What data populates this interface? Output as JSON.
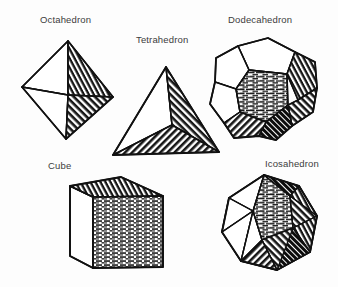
{
  "page": {
    "background_color": "#fdfdfd",
    "ink_color": "#1a1a1a",
    "label_color": "#3c3c3c",
    "width": 338,
    "height": 287,
    "style": "black-and-white scanned pen-and-ink line drawing with hatched shading"
  },
  "figures": [
    {
      "id": "octahedron",
      "label": "Octahedron",
      "faces": 8,
      "face_shape": "triangle",
      "label_position": {
        "x": 40,
        "y": 14
      },
      "shading": "right-hand faces hatched dark, left-hand faces left white"
    },
    {
      "id": "tetrahedron",
      "label": "Tetrahedron",
      "faces": 4,
      "face_shape": "triangle",
      "label_position": {
        "x": 136,
        "y": 34
      },
      "shading": "right face and bottom face hatched dark, left face white"
    },
    {
      "id": "dodecahedron",
      "label": "Dodecahedron",
      "faces": 12,
      "face_shape": "pentagon",
      "label_position": {
        "x": 228,
        "y": 14
      },
      "shading": "upper-left pentagons white, front and right pentagons hatched dark"
    },
    {
      "id": "cube",
      "label": "Cube",
      "faces": 6,
      "face_shape": "square",
      "label_position": {
        "x": 48,
        "y": 160
      },
      "shading": "front face horizontally hatched, top face diagonally hatched, left face white"
    },
    {
      "id": "icosahedron",
      "label": "Icosahedron",
      "faces": 20,
      "face_shape": "triangle",
      "label_position": {
        "x": 265,
        "y": 158
      },
      "shading": "left triangles white, central and right triangles hatched dark"
    }
  ]
}
